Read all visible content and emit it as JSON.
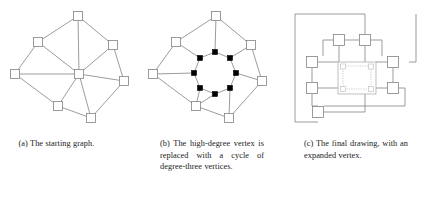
{
  "document": {
    "kind": "figure-triptych",
    "background_color": "#ffffff",
    "edge_color": "#8a8a8a",
    "node_fill_color": "#ffffff",
    "filled_node_color": "#000000",
    "expanded_vertex_color": "#c0c0c0",
    "text_color": "#1a1a1a"
  },
  "figures": [
    {
      "id": "a",
      "label": "(a)",
      "caption": "(a) The starting graph.",
      "graph": {
        "node_size": 9,
        "nodes": [
          {
            "id": "n-top",
            "x": 78,
            "y": 16,
            "type": "open"
          },
          {
            "id": "n-upleft",
            "x": 38,
            "y": 42,
            "type": "open"
          },
          {
            "id": "n-upright",
            "x": 113,
            "y": 45,
            "type": "open"
          },
          {
            "id": "n-left",
            "x": 15,
            "y": 74,
            "type": "open"
          },
          {
            "id": "n-hub",
            "x": 79,
            "y": 74,
            "type": "open"
          },
          {
            "id": "n-right",
            "x": 124,
            "y": 81,
            "type": "open"
          },
          {
            "id": "n-botleft",
            "x": 58,
            "y": 106,
            "type": "open"
          },
          {
            "id": "n-botright",
            "x": 91,
            "y": 118,
            "type": "open"
          }
        ],
        "edges": [
          [
            "n-top",
            "n-upleft"
          ],
          [
            "n-top",
            "n-upright"
          ],
          [
            "n-top",
            "n-hub"
          ],
          [
            "n-upleft",
            "n-left"
          ],
          [
            "n-upleft",
            "n-hub"
          ],
          [
            "n-upright",
            "n-hub"
          ],
          [
            "n-upright",
            "n-right"
          ],
          [
            "n-left",
            "n-hub"
          ],
          [
            "n-left",
            "n-botleft"
          ],
          [
            "n-hub",
            "n-right"
          ],
          [
            "n-hub",
            "n-botleft"
          ],
          [
            "n-hub",
            "n-botright"
          ],
          [
            "n-botleft",
            "n-botright"
          ],
          [
            "n-botright",
            "n-right"
          ]
        ]
      }
    },
    {
      "id": "b",
      "label": "(b)",
      "caption": "(b) The high-degree vertex is replaced with a cycle of degree-three vertices.",
      "graph": {
        "node_size": 9,
        "filled_node_size": 5,
        "nodes": [
          {
            "id": "n-top",
            "x": 75,
            "y": 16,
            "type": "open"
          },
          {
            "id": "n-upleft",
            "x": 35,
            "y": 42,
            "type": "open"
          },
          {
            "id": "n-upright",
            "x": 110,
            "y": 45,
            "type": "open"
          },
          {
            "id": "n-left",
            "x": 12,
            "y": 74,
            "type": "open"
          },
          {
            "id": "n-right",
            "x": 121,
            "y": 81,
            "type": "open"
          },
          {
            "id": "n-botleft",
            "x": 55,
            "y": 106,
            "type": "open"
          },
          {
            "id": "n-botright",
            "x": 88,
            "y": 118,
            "type": "open"
          },
          {
            "id": "c0",
            "x": 74,
            "y": 52,
            "type": "filled"
          },
          {
            "id": "c1",
            "x": 89,
            "y": 58,
            "type": "filled"
          },
          {
            "id": "c2",
            "x": 95,
            "y": 73,
            "type": "filled"
          },
          {
            "id": "c3",
            "x": 89,
            "y": 88,
            "type": "filled"
          },
          {
            "id": "c4",
            "x": 74,
            "y": 94,
            "type": "filled"
          },
          {
            "id": "c5",
            "x": 59,
            "y": 88,
            "type": "filled"
          },
          {
            "id": "c6",
            "x": 53,
            "y": 73,
            "type": "filled"
          },
          {
            "id": "c7",
            "x": 59,
            "y": 58,
            "type": "filled"
          }
        ],
        "edges": [
          [
            "n-top",
            "n-upleft"
          ],
          [
            "n-top",
            "n-upright"
          ],
          [
            "n-upleft",
            "n-left"
          ],
          [
            "n-upright",
            "n-right"
          ],
          [
            "n-left",
            "n-botleft"
          ],
          [
            "n-botleft",
            "n-botright"
          ],
          [
            "n-botright",
            "n-right"
          ],
          [
            "c0",
            "c1"
          ],
          [
            "c1",
            "c2"
          ],
          [
            "c2",
            "c3"
          ],
          [
            "c3",
            "c4"
          ],
          [
            "c4",
            "c5"
          ],
          [
            "c5",
            "c6"
          ],
          [
            "c6",
            "c7"
          ],
          [
            "c7",
            "c0"
          ],
          [
            "n-top",
            "c0"
          ],
          [
            "n-upright",
            "c1"
          ],
          [
            "n-right",
            "c2"
          ],
          [
            "n-botright",
            "c3"
          ],
          [
            "n-botleft",
            "c4"
          ],
          [
            "n-botleft",
            "c5"
          ],
          [
            "n-left",
            "c6"
          ],
          [
            "n-upleft",
            "c7"
          ]
        ]
      }
    },
    {
      "id": "c",
      "label": "(c)",
      "caption": "(c) The final drawing, with an expanded vertex.",
      "graph": {
        "node_size": 11,
        "orthogonal": true,
        "nodes": [
          {
            "id": "t1",
            "x": 56,
            "y": 40,
            "type": "open"
          },
          {
            "id": "t2",
            "x": 82,
            "y": 40,
            "type": "open"
          },
          {
            "id": "l1",
            "x": 29,
            "y": 62,
            "type": "open"
          },
          {
            "id": "l2",
            "x": 29,
            "y": 88,
            "type": "open"
          },
          {
            "id": "r1",
            "x": 110,
            "y": 62,
            "type": "open"
          },
          {
            "id": "r2",
            "x": 110,
            "y": 88,
            "type": "open"
          },
          {
            "id": "b1",
            "x": 35,
            "y": 112,
            "type": "open"
          }
        ],
        "expanded_vertex": {
          "x": 55,
          "y": 62,
          "width": 38,
          "height": 32
        }
      }
    }
  ]
}
